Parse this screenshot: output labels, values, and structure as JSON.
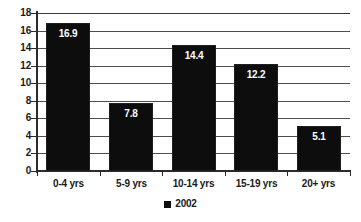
{
  "chart_data": {
    "type": "bar",
    "title": "",
    "xlabel": "",
    "ylabel": "",
    "categories": [
      "0-4 yrs",
      "5-9 yrs",
      "10-14 yrs",
      "15-19 yrs",
      "20+ yrs"
    ],
    "series": [
      {
        "name": "2002",
        "values": [
          16.9,
          7.8,
          14.4,
          12.2,
          5.1
        ],
        "color": "#0d0d0d"
      }
    ],
    "data_labels": [
      "16.9",
      "7.8",
      "14.4",
      "12.2",
      "5.1"
    ],
    "ylim": [
      0,
      18
    ],
    "ytick_step": 2,
    "ytick_labels": [
      "18",
      "16",
      "14",
      "12",
      "10",
      "8",
      "6",
      "4",
      "2",
      "0"
    ],
    "grid": true,
    "grid_axis": "y",
    "legend_position": "bottom-center",
    "legend_entries": [
      {
        "label": "2002",
        "marker": "square",
        "color": "#0d0d0d"
      }
    ],
    "background_color": "#ffffff",
    "axis_color": "#2b2b2b",
    "gridline_color": "#4d4d4d"
  }
}
